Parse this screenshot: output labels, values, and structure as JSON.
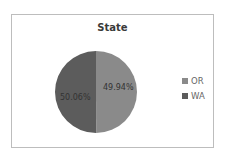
{
  "chart_data": {
    "type": "pie",
    "title": "State",
    "categories": [
      "OR",
      "WA"
    ],
    "values": [
      49.94,
      50.06
    ],
    "labels": [
      "49.94%",
      "50.06%"
    ],
    "colors": [
      "#8a8a8a",
      "#5c5c5c"
    ],
    "legend_position": "right"
  },
  "legend": {
    "items": [
      {
        "label": "OR",
        "color": "#8a8a8a"
      },
      {
        "label": "WA",
        "color": "#5c5c5c"
      }
    ]
  }
}
